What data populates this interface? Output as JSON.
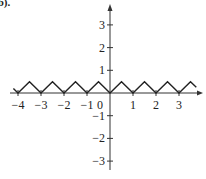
{
  "corner_label": "(b).",
  "chart_data": {
    "type": "line",
    "title": "",
    "xlabel": "",
    "ylabel": "",
    "xlim": [
      -4.3,
      4.0
    ],
    "ylim": [
      -3.4,
      3.9
    ],
    "grid": false,
    "x_ticks": [
      -4,
      -3,
      -2,
      -1,
      1,
      2,
      3
    ],
    "x_tick_labels": [
      "−4",
      "−3",
      "−2",
      "−1",
      "1",
      "2",
      "3"
    ],
    "origin_label": "0",
    "y_ticks": [
      3,
      2,
      1,
      -1,
      -2,
      -3
    ],
    "y_tick_labels": [
      "3",
      "2",
      "1",
      "−1",
      "−2",
      "−3"
    ],
    "series": [
      {
        "name": "f(x)",
        "x": [
          -4.2,
          -4,
          -3.5,
          -3,
          -2.5,
          -2,
          -1.5,
          -1,
          -0.5,
          0,
          0.5,
          1,
          1.5,
          2,
          2.5,
          3,
          3.5,
          3.75
        ],
        "y": [
          0.2,
          0,
          0.5,
          0,
          0.5,
          0,
          0.5,
          0,
          0.5,
          0,
          0.5,
          0,
          0.5,
          0,
          0.5,
          0,
          0.5,
          0.25
        ]
      }
    ],
    "colors": {
      "line": "#222222",
      "axis": "#333333"
    }
  },
  "layout": {
    "origin_px": [
      110,
      93
    ],
    "unit_x_px": 23,
    "unit_y_px": 22.7,
    "x_axis_px": [
      10,
      203
    ],
    "y_axis_px": [
      170,
      4
    ]
  }
}
